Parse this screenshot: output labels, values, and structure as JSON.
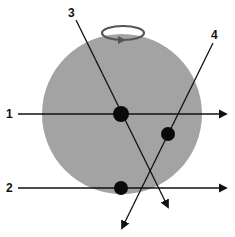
{
  "diagram": {
    "type": "rotating-sphere-ray-paths",
    "colors": {
      "sphere": "#a3a3a3",
      "line": "#111111",
      "dot": "#0a0a0a",
      "rotation_arrow": "#555555",
      "background": "#ffffff"
    },
    "sphere": {
      "cx": 122,
      "cy": 114,
      "r": 80
    },
    "rotation_indicator": {
      "cx": 123,
      "cy": 33,
      "rx": 21,
      "ry": 7,
      "direction": "clockwise-front-right"
    },
    "paths": [
      {
        "label": "1",
        "x1": 18,
        "y1": 114,
        "x2": 226,
        "y2": 114,
        "label_x": 6,
        "label_y": 118
      },
      {
        "label": "2",
        "x1": 18,
        "y1": 188,
        "x2": 226,
        "y2": 188,
        "label_x": 6,
        "label_y": 192
      },
      {
        "label": "3",
        "x1": 76,
        "y1": 20,
        "x2": 168,
        "y2": 207,
        "label_x": 68,
        "label_y": 17
      },
      {
        "label": "4",
        "x1": 213,
        "y1": 43,
        "x2": 122,
        "y2": 228,
        "label_x": 211,
        "label_y": 39
      }
    ],
    "points": [
      {
        "name": "intersection-1-3",
        "cx": 121,
        "cy": 114,
        "r": 8
      },
      {
        "name": "point-on-4",
        "cx": 168,
        "cy": 134,
        "r": 7
      },
      {
        "name": "point-on-2",
        "cx": 121,
        "cy": 188,
        "r": 7
      }
    ]
  }
}
